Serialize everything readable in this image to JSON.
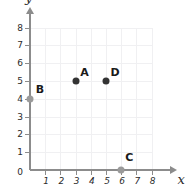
{
  "chart_data": {
    "type": "scatter",
    "title": "",
    "xlabel": "x",
    "ylabel": "y",
    "xlim": [
      0,
      8
    ],
    "ylim": [
      0,
      8
    ],
    "grid": true,
    "legend": "none",
    "x_ticks": [
      "1",
      "2",
      "3",
      "4",
      "5",
      "6",
      "7",
      "8"
    ],
    "y_ticks": [
      "1",
      "2",
      "3",
      "4",
      "5",
      "6",
      "7",
      "8"
    ],
    "origin_label": "0",
    "points": [
      {
        "label": "A",
        "x": 3,
        "y": 5,
        "color": "#333333",
        "label_dx": 9,
        "label_dy": -9
      },
      {
        "label": "B",
        "x": 0,
        "y": 4,
        "color": "#9a9a9a",
        "label_dx": 10,
        "label_dy": -10
      },
      {
        "label": "C",
        "x": 6,
        "y": 0,
        "color": "#9a9a9a",
        "label_dx": 8,
        "label_dy": -13
      },
      {
        "label": "D",
        "x": 5,
        "y": 5,
        "color": "#333333",
        "label_dx": 9,
        "label_dy": -9
      }
    ]
  },
  "colors": {
    "axis": "#8c8c8c",
    "grid": "#f0f0f2",
    "text": "#2b2b2b",
    "point_dark": "#333333",
    "point_light": "#9a9a9a",
    "background": "#ffffff"
  }
}
